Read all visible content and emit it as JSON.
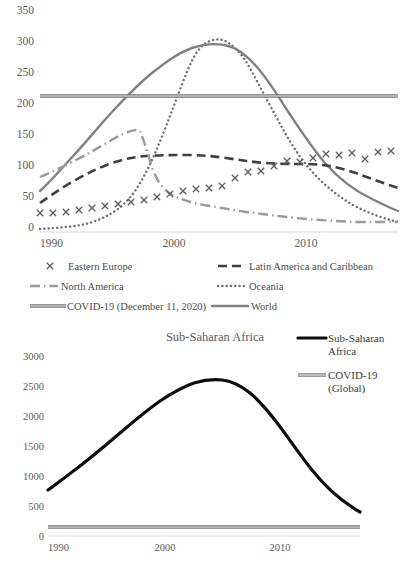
{
  "chart_data": [
    {
      "type": "line",
      "title": "",
      "xlabel": "",
      "ylabel": "",
      "xlim": [
        1990,
        2017
      ],
      "ylim": [
        0,
        350
      ],
      "xticks": [
        "1990",
        "2000",
        "2010"
      ],
      "yticks": [
        "0",
        "50",
        "100",
        "150",
        "200",
        "250",
        "300",
        "350"
      ],
      "grid": false,
      "legend_position": "bottom",
      "x": [
        1990,
        1991,
        1992,
        1993,
        1994,
        1995,
        1996,
        1997,
        1998,
        1999,
        2000,
        2001,
        2002,
        2003,
        2004,
        2005,
        2006,
        2007,
        2008,
        2009,
        2010,
        2011,
        2012,
        2013,
        2014,
        2015,
        2016,
        2017
      ],
      "series": [
        {
          "name": "Eastern Europe",
          "style": "marker-x",
          "color": "#5f5f5f",
          "values": [
            22,
            22,
            24,
            26,
            29,
            32,
            35,
            38,
            41,
            45,
            50,
            55,
            58,
            60,
            63,
            72,
            79,
            80,
            86,
            92,
            91,
            95,
            101,
            100,
            102,
            93,
            104,
            105
          ]
        },
        {
          "name": "Latin America and Caribbean",
          "style": "dashed",
          "color": "#3f3f3f",
          "values": [
            46,
            58,
            70,
            80,
            88,
            95,
            101,
            106,
            105,
            104,
            104,
            105,
            105,
            104,
            102,
            99,
            96,
            93,
            94,
            95,
            94,
            92,
            89,
            86,
            82,
            79,
            75,
            71
          ]
        },
        {
          "name": "North America",
          "style": "dash-dot",
          "color": "#9a9a9a",
          "values": [
            88,
            93,
            101,
            110,
            120,
            132,
            136,
            93,
            63,
            55,
            50,
            47,
            46,
            44,
            41,
            38,
            34,
            31,
            28,
            26,
            24,
            22,
            20,
            19,
            18,
            17,
            17,
            17
          ]
        },
        {
          "name": "Oceania",
          "style": "dotted",
          "color": "#6e6e6e",
          "values": [
            5,
            5,
            6,
            6,
            7,
            8,
            10,
            13,
            18,
            26,
            40,
            60,
            95,
            140,
            190,
            235,
            268,
            283,
            286,
            283,
            272,
            256,
            236,
            212,
            190,
            165,
            143,
            122
          ]
        },
        {
          "name": "COVID-19 (December 11, 2020)",
          "style": "double-line",
          "color": "#707070",
          "constant": 205
        },
        {
          "name": "World",
          "style": "solid",
          "color": "#808080",
          "values": [
            66,
            88,
            112,
            138,
            163,
            186,
            208,
            228,
            248,
            265,
            278,
            286,
            291,
            293,
            292,
            288,
            280,
            269,
            256,
            240,
            222,
            203,
            186,
            170,
            156,
            143,
            132,
            122
          ]
        }
      ]
    },
    {
      "type": "line",
      "title": "Sub-Saharan Africa",
      "xlabel": "",
      "ylabel": "",
      "xlim": [
        1990,
        2017
      ],
      "ylim": [
        0,
        3000
      ],
      "xticks": [
        "1990",
        "2000",
        "2010"
      ],
      "yticks": [
        "0",
        "500",
        "1000",
        "1500",
        "2000",
        "2500",
        "3000"
      ],
      "grid": false,
      "legend_position": "right",
      "x": [
        1990,
        1991,
        1992,
        1993,
        1994,
        1995,
        1996,
        1997,
        1998,
        1999,
        2000,
        2001,
        2002,
        2003,
        2004,
        2005,
        2006,
        2007,
        2008,
        2009,
        2010,
        2011,
        2012,
        2013,
        2014,
        2015,
        2016,
        2017
      ],
      "series": [
        {
          "name": "Sub-Saharan Africa",
          "style": "solid-thick",
          "color": "#0d0d0d",
          "values": [
            680,
            830,
            980,
            1130,
            1290,
            1450,
            1610,
            1770,
            1930,
            2090,
            2250,
            2400,
            2560,
            2690,
            2780,
            2770,
            2720,
            2640,
            2540,
            2420,
            2280,
            2120,
            1950,
            1760,
            1560,
            1350,
            1120,
            860
          ]
        },
        {
          "name": "COVID-19 (Global)",
          "style": "double-line",
          "color": "#707070",
          "constant": 205
        }
      ]
    }
  ],
  "top": {
    "yticks": [
      "350",
      "300",
      "250",
      "200",
      "150",
      "100",
      "50",
      "0"
    ],
    "xticks": [
      "1990",
      "2000",
      "2010"
    ],
    "legend": [
      {
        "label": "Eastern Europe",
        "marker": "x-marker-icon"
      },
      {
        "label": "Latin America and Caribbean",
        "marker": "dashed-line-icon"
      },
      {
        "label": "North America",
        "marker": "dash-dot-line-icon"
      },
      {
        "label": "Oceania",
        "marker": "dotted-line-icon"
      },
      {
        "label": "COVID-19 (December 11, 2020)",
        "marker": "double-line-icon"
      },
      {
        "label": "World",
        "marker": "solid-line-icon"
      }
    ]
  },
  "bottom": {
    "title": "Sub-Saharan Africa",
    "yticks": [
      "3000",
      "2500",
      "2000",
      "1500",
      "1000",
      "500",
      "0"
    ],
    "xticks": [
      "1990",
      "2000",
      "2010"
    ],
    "legend": [
      {
        "label_line1": "Sub-Saharan",
        "label_line2": "Africa",
        "marker": "solid-thick-line-icon"
      },
      {
        "label_line1": "COVID-19",
        "label_line2": "(Global)",
        "marker": "double-line-icon"
      }
    ]
  }
}
